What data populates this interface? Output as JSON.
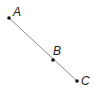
{
  "diagram": {
    "type": "collinear-points",
    "line_color": "#8a8a8a",
    "point_color": "#111111",
    "points": [
      {
        "label": "A",
        "x": 9,
        "y": 18,
        "label_x": 13,
        "label_y": 16
      },
      {
        "label": "B",
        "x": 53,
        "y": 60,
        "label_x": 53,
        "label_y": 55
      },
      {
        "label": "C",
        "x": 77,
        "y": 81,
        "label_x": 81,
        "label_y": 85
      }
    ]
  }
}
